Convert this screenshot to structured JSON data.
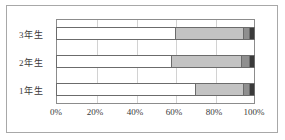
{
  "chart_data": {
    "type": "bar",
    "subtype": "100% stacked horizontal bar",
    "title": "",
    "xlabel": "",
    "ylabel": "",
    "categories": [
      "3年生",
      "2年生",
      "1年生"
    ],
    "category_order_top_to_bottom": [
      "3年生",
      "2年生",
      "1年生"
    ],
    "series": [
      {
        "name": "series-1",
        "color": "#ffffff",
        "values": [
          60,
          58,
          70
        ]
      },
      {
        "name": "series-2",
        "color": "#c3c3c3",
        "values": [
          34,
          35,
          24
        ]
      },
      {
        "name": "series-3",
        "color": "#8f8f8f",
        "values": [
          3,
          4,
          3
        ]
      },
      {
        "name": "series-4",
        "color": "#3a3a3a",
        "values": [
          3,
          3,
          3
        ]
      }
    ],
    "xlim": [
      0,
      100
    ],
    "xticks": [
      0,
      20,
      40,
      60,
      80,
      100
    ],
    "xtick_labels": [
      "0%",
      "20%",
      "40%",
      "60%",
      "80%",
      "100%"
    ],
    "grid": true,
    "grid_axis": "x",
    "legend": false,
    "legend_position": "none",
    "units": "percent"
  },
  "colors": {
    "frame": "#a8a8a8",
    "plot_border": "#8c8c8c",
    "gridline": "#d2d2d2",
    "bar_outline": "#6b6b6b",
    "text": "#3a3a3a",
    "background": "#ffffff"
  },
  "axis": {
    "tick_labels": [
      "0%",
      "20%",
      "40%",
      "60%",
      "80%",
      "100%"
    ]
  }
}
